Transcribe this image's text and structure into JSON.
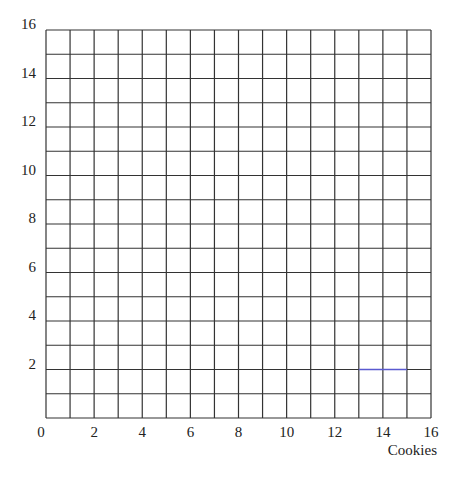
{
  "chart_data": {
    "type": "line",
    "title": "",
    "xlabel": "Cookies",
    "ylabel": "",
    "xlim": [
      0,
      16
    ],
    "ylim": [
      0,
      16
    ],
    "grid": true,
    "grid_step": 1,
    "x_ticks": [
      0,
      2,
      4,
      6,
      8,
      10,
      12,
      14,
      16
    ],
    "y_ticks": [
      2,
      4,
      6,
      8,
      10,
      12,
      14,
      16
    ],
    "x_tick_labels": [
      "0",
      "2",
      "4",
      "6",
      "8",
      "10",
      "12",
      "14",
      "16"
    ],
    "y_tick_labels": [
      "2",
      "4",
      "6",
      "8",
      "10",
      "12",
      "14",
      "16"
    ],
    "series": [
      {
        "name": "segment",
        "color": "#5a5ad0",
        "x": [
          13,
          15
        ],
        "y": [
          2,
          2
        ]
      }
    ],
    "legend": null
  },
  "colors": {
    "grid": "#333333",
    "background": "#ffffff",
    "segment": "#5a5ad0"
  }
}
